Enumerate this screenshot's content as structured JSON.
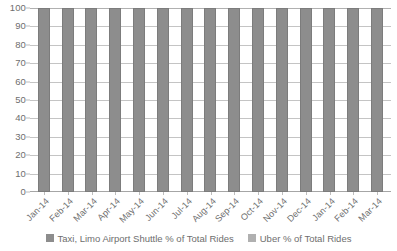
{
  "chart_data": {
    "type": "bar",
    "subtype": "100% stacked column",
    "title": "",
    "xlabel": "",
    "ylabel": "",
    "ylim": [
      0,
      100
    ],
    "y_ticks": [
      0,
      10,
      20,
      30,
      40,
      50,
      60,
      70,
      80,
      90,
      100
    ],
    "grid": true,
    "legend_position": "bottom",
    "categories": [
      "Jan-14",
      "Feb-14",
      "Mar-14",
      "Apr-14",
      "May-14",
      "Jun-14",
      "Jul-14",
      "Aug-14",
      "Sep-14",
      "Oct-14",
      "Nov-14",
      "Dec-14",
      "Jan-14",
      "Feb-14",
      "Mar-14"
    ],
    "series": [
      {
        "name": "Taxi, Limo Airport Shuttle % of Total Rides",
        "color": "#8d8d8d",
        "values": [
          100,
          100,
          100,
          100,
          100,
          100,
          100,
          100,
          100,
          100,
          100,
          100,
          100,
          100,
          100
        ]
      },
      {
        "name": "Uber % of Total Rides",
        "color": "#b0b0b0",
        "values": [
          0,
          0,
          0,
          0,
          0,
          0,
          0,
          0,
          0,
          0,
          0,
          0,
          0,
          0,
          0
        ]
      }
    ]
  },
  "legend": {
    "items": [
      {
        "label": "Taxi, Limo Airport Shuttle % of Total Rides"
      },
      {
        "label": "Uber % of Total Rides"
      }
    ]
  }
}
